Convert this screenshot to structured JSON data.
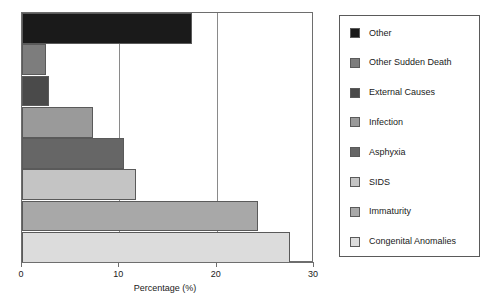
{
  "chart_data": {
    "type": "bar",
    "orientation": "horizontal",
    "title": "",
    "xlabel": "Percentage (%)",
    "ylabel": "",
    "xlim": [
      0,
      30
    ],
    "xticks": [
      "0",
      "10",
      "20",
      "30"
    ],
    "xtick_values": [
      0,
      10,
      20,
      30
    ],
    "grid": true,
    "grid_axis": "x",
    "legend_position": "right",
    "categories": [
      "Other",
      "Other Sudden Death",
      "External Causes",
      "Infection",
      "Asphyxia",
      "SIDS",
      "Immaturity",
      "Congenital Anomalies"
    ],
    "values": [
      17.5,
      2.5,
      2.8,
      7.3,
      10.5,
      11.7,
      24.2,
      27.5
    ],
    "colors": [
      "#1a1a1a",
      "#7d7d7d",
      "#4a4a4a",
      "#9a9a9a",
      "#666666",
      "#c4c4c4",
      "#a8a8a8",
      "#dcdcdc"
    ]
  },
  "legend": {
    "items": [
      {
        "label": "Other",
        "color": "#1a1a1a"
      },
      {
        "label": "Other Sudden Death",
        "color": "#7d7d7d"
      },
      {
        "label": "External Causes",
        "color": "#4a4a4a"
      },
      {
        "label": "Infection",
        "color": "#9a9a9a"
      },
      {
        "label": "Asphyxia",
        "color": "#666666"
      },
      {
        "label": "SIDS",
        "color": "#c4c4c4"
      },
      {
        "label": "Immaturity",
        "color": "#a8a8a8"
      },
      {
        "label": "Congenital Anomalies",
        "color": "#dcdcdc"
      }
    ]
  },
  "axis": {
    "x_title": "Percentage (%)",
    "ticks": [
      "0",
      "10",
      "20",
      "30"
    ]
  }
}
